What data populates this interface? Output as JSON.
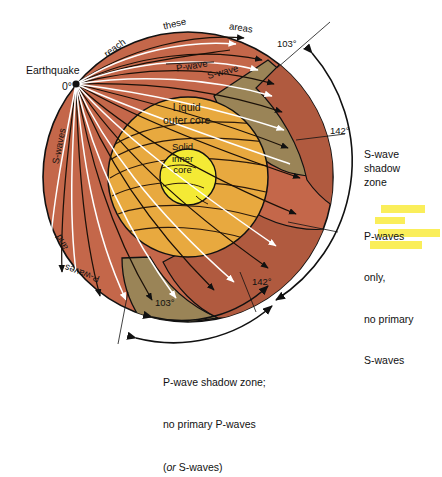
{
  "figure": {
    "type": "cross-section-diagram",
    "background_color": "#ffffff"
  },
  "colors": {
    "mantle": "#c4674a",
    "mantle_dark": "#b05a3f",
    "shadow_band": "#9a8457",
    "outer_core": "#e8a93f",
    "inner_core": "#f4ea35",
    "ray_p": "#1a1008",
    "ray_s": "#ffffff",
    "outline": "#111111",
    "highlight": "#faee5a"
  },
  "labels": {
    "earthquake": "Earthquake",
    "focus_angle": "0°",
    "liquid_outer_core": "Liquid\nouter core",
    "solid_inner_core": "Solid\ninner\ncore",
    "p_wave_ray": "P-wave",
    "s_wave_ray": "S-wave",
    "arc_top_1": "reach",
    "arc_top_2": "these",
    "arc_top_3": "areas",
    "arc_left_1": "S-waves",
    "arc_left_2": "and",
    "arc_left_3": "P-waves"
  },
  "angles": {
    "top_right": "103°",
    "mid_right": "142°",
    "bottom_right": "142°",
    "bottom_left": "103°"
  },
  "annotations": {
    "s_wave_shadow": "S-wave\nshadow\nzone",
    "p_only_line1": "P-waves",
    "p_only_line2": "only,",
    "p_only_line3": "no primary",
    "p_only_line4": "S-waves",
    "caption_line1": "P-wave shadow zone;",
    "caption_line2": "no primary P-waves",
    "caption_line3_pre": "(",
    "caption_line3_ital": "or",
    "caption_line3_post": " S-waves)"
  },
  "geometry": {
    "earth_center_x": 188,
    "earth_center_y": 177,
    "earth_radius": 145,
    "outer_core_radius": 80,
    "inner_core_radius": 28,
    "focus_x": 76,
    "focus_y": 84
  }
}
